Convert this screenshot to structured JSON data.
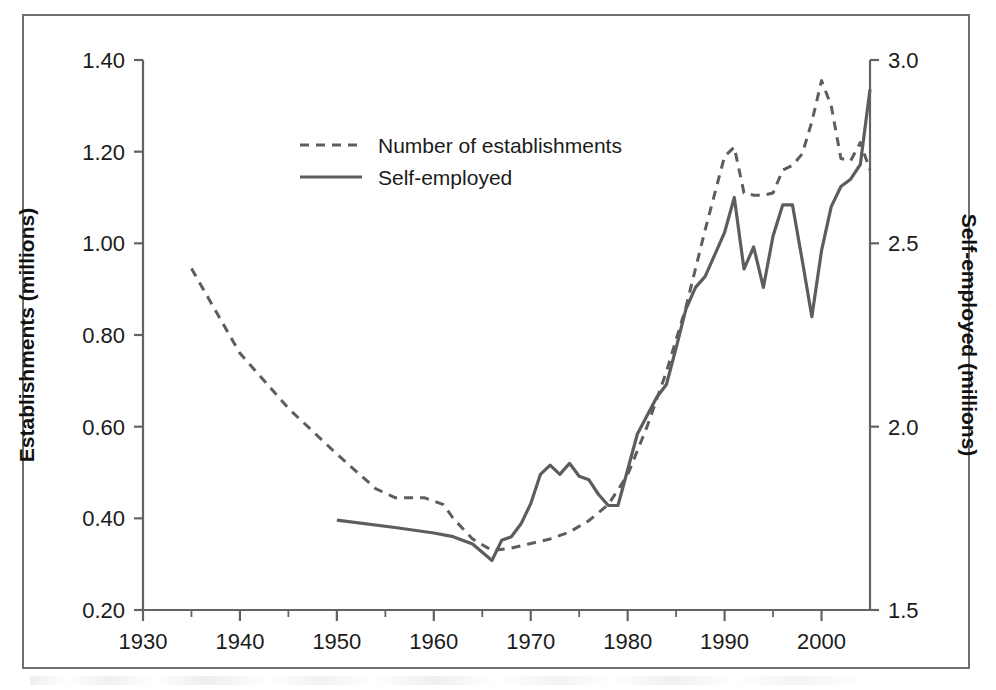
{
  "figure": {
    "border_color": "#6f6f70",
    "line_color": "#5d5d5e"
  },
  "legend": {
    "position": "upper-center-left",
    "entries": [
      {
        "label": "Number of establishments",
        "style": "dashed",
        "axis": "left"
      },
      {
        "label": "Self-employed",
        "style": "solid",
        "axis": "right"
      }
    ]
  },
  "chart_data": {
    "type": "line",
    "title": "",
    "subtitle": "",
    "xlabel": "",
    "ylabel": "Establishments (millions)",
    "y2label": "Self-employed (millions)",
    "grid": false,
    "xlim": [
      1930,
      2005
    ],
    "ylim": [
      0.2,
      1.4
    ],
    "y2lim": [
      1.5,
      3.0
    ],
    "xticks": [
      1930,
      1940,
      1950,
      1960,
      1970,
      1980,
      1990,
      2000
    ],
    "xtick_labels": [
      "1930",
      "1940",
      "1950",
      "1960",
      "1970",
      "1980",
      "1990",
      "2000"
    ],
    "xticks_minor": [
      1935,
      1945,
      1955,
      1965,
      1975,
      1985,
      1995
    ],
    "yticks": [
      0.2,
      0.4,
      0.6,
      0.8,
      1.0,
      1.2,
      1.4
    ],
    "ytick_labels": [
      "0.20",
      "0.40",
      "0.60",
      "0.80",
      "1.00",
      "1.20",
      "1.40"
    ],
    "y2ticks": [
      1.5,
      2.0,
      2.5,
      3.0
    ],
    "y2tick_labels": [
      "1.5",
      "2.0",
      "2.5",
      "3.0"
    ],
    "series": [
      {
        "name": "Number of establishments",
        "style": "dashed",
        "axis": "left",
        "units": "millions",
        "x": [
          1935,
          1940,
          1945,
          1950,
          1954,
          1956,
          1959,
          1961,
          1962,
          1964,
          1966,
          1968,
          1970,
          1972,
          1974,
          1976,
          1978,
          1980,
          1982,
          1984,
          1986,
          1988,
          1990,
          1991,
          1992,
          1993,
          1994,
          1995,
          1996,
          1997,
          1998,
          1999,
          2000,
          2001,
          2002,
          2003,
          2004,
          2005
        ],
        "y": [
          0.945,
          0.76,
          0.64,
          0.54,
          0.465,
          0.445,
          0.445,
          0.43,
          0.4,
          0.355,
          0.33,
          0.335,
          0.345,
          0.355,
          0.37,
          0.395,
          0.43,
          0.495,
          0.6,
          0.72,
          0.86,
          1.03,
          1.19,
          1.21,
          1.11,
          1.105,
          1.105,
          1.11,
          1.16,
          1.17,
          1.195,
          1.265,
          1.355,
          1.3,
          1.185,
          1.18,
          1.22,
          1.16
        ]
      },
      {
        "name": "Self-employed",
        "style": "solid",
        "axis": "right",
        "units": "millions",
        "x": [
          1950,
          1956,
          1960,
          1962,
          1964,
          1966,
          1967,
          1968,
          1969,
          1970,
          1971,
          1972,
          1973,
          1974,
          1975,
          1976,
          1977,
          1978,
          1979,
          1981,
          1983,
          1984,
          1985,
          1986,
          1987,
          1988,
          1989,
          1990,
          1991,
          1992,
          1993,
          1994,
          1995,
          1996,
          1997,
          1998,
          1999,
          2000,
          2001,
          2002,
          2003,
          2004,
          2005
        ],
        "y": [
          1.745,
          1.725,
          1.71,
          1.7,
          1.68,
          1.635,
          1.69,
          1.7,
          1.735,
          1.79,
          1.87,
          1.895,
          1.87,
          1.9,
          1.865,
          1.855,
          1.815,
          1.785,
          1.785,
          1.98,
          2.08,
          2.115,
          2.215,
          2.32,
          2.38,
          2.41,
          2.47,
          2.53,
          2.625,
          2.43,
          2.49,
          2.38,
          2.52,
          2.605,
          2.605,
          2.455,
          2.3,
          2.48,
          2.6,
          2.655,
          2.675,
          2.715,
          2.92
        ]
      }
    ]
  }
}
